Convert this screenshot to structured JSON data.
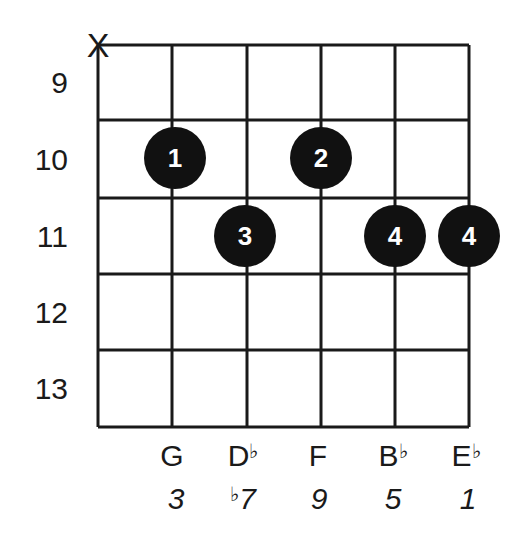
{
  "diagram": {
    "type": "guitar-chord-diagram",
    "muted_strings": [
      {
        "string": 1,
        "symbol": "X"
      }
    ],
    "fret_numbers": [
      "9",
      "10",
      "11",
      "12",
      "13"
    ],
    "fingers": [
      {
        "string": 2,
        "fret_row": 2,
        "label": "1"
      },
      {
        "string": 4,
        "fret_row": 2,
        "label": "2"
      },
      {
        "string": 3,
        "fret_row": 3,
        "label": "3"
      },
      {
        "string": 5,
        "fret_row": 3,
        "label": "4"
      },
      {
        "string": 6,
        "fret_row": 3,
        "label": "4"
      }
    ],
    "notes": [
      {
        "string": 2,
        "name": "G",
        "accidental": ""
      },
      {
        "string": 3,
        "name": "D",
        "accidental": "♭"
      },
      {
        "string": 4,
        "name": "F",
        "accidental": ""
      },
      {
        "string": 5,
        "name": "B",
        "accidental": "♭"
      },
      {
        "string": 6,
        "name": "E",
        "accidental": "♭"
      }
    ],
    "intervals": [
      {
        "string": 2,
        "prefix": "",
        "value": "3"
      },
      {
        "string": 3,
        "prefix": "♭",
        "value": "7"
      },
      {
        "string": 4,
        "prefix": "",
        "value": "9"
      },
      {
        "string": 5,
        "prefix": "",
        "value": "5"
      },
      {
        "string": 6,
        "prefix": "",
        "value": "1"
      }
    ],
    "colors": {
      "line": "#1a1a1a",
      "dot": "#111111",
      "dot_text": "#ffffff",
      "background": "#ffffff"
    }
  }
}
